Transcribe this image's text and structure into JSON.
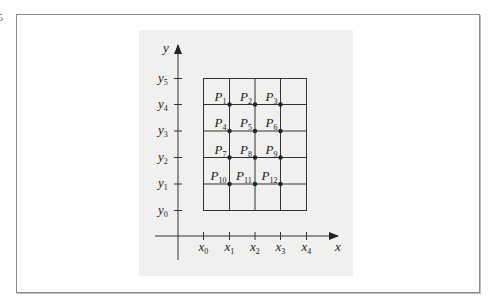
{
  "figure": {
    "fragment_text": "5",
    "axes": {
      "x_label": "x",
      "y_label": "y",
      "x_ticks": [
        {
          "base": "x",
          "sub": "0"
        },
        {
          "base": "x",
          "sub": "1"
        },
        {
          "base": "x",
          "sub": "2"
        },
        {
          "base": "x",
          "sub": "3"
        },
        {
          "base": "x",
          "sub": "4"
        }
      ],
      "y_ticks": [
        {
          "base": "y",
          "sub": "0"
        },
        {
          "base": "y",
          "sub": "1"
        },
        {
          "base": "y",
          "sub": "2"
        },
        {
          "base": "y",
          "sub": "3"
        },
        {
          "base": "y",
          "sub": "4"
        },
        {
          "base": "y",
          "sub": "5"
        }
      ]
    },
    "grid": {
      "columns": 4,
      "rows": 5
    },
    "points": [
      {
        "base": "P",
        "sub": "1"
      },
      {
        "base": "P",
        "sub": "2"
      },
      {
        "base": "P",
        "sub": "3"
      },
      {
        "base": "P",
        "sub": "4"
      },
      {
        "base": "P",
        "sub": "5"
      },
      {
        "base": "P",
        "sub": "6"
      },
      {
        "base": "P",
        "sub": "7"
      },
      {
        "base": "P",
        "sub": "8"
      },
      {
        "base": "P",
        "sub": "9"
      },
      {
        "base": "P",
        "sub": "10"
      },
      {
        "base": "P",
        "sub": "11"
      },
      {
        "base": "P",
        "sub": "12"
      }
    ],
    "colors": {
      "panel": "#f0f0ee",
      "ink": "#222222",
      "frame": "#8a8a8a"
    }
  }
}
